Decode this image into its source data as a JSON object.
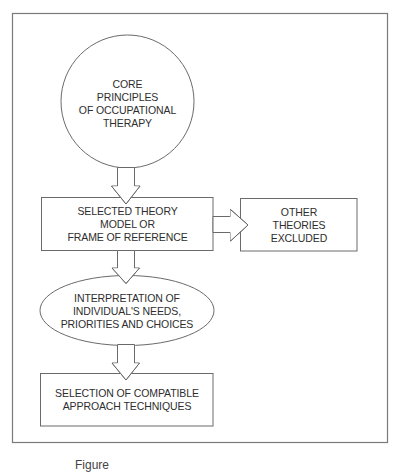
{
  "diagram": {
    "type": "flowchart",
    "nodes": [
      {
        "id": "core",
        "shape": "circle",
        "lines": [
          "CORE",
          "PRINCIPLES",
          "OF OCCUPATIONAL",
          "THERAPY"
        ]
      },
      {
        "id": "theory",
        "shape": "rectangle",
        "lines": [
          "SELECTED THEORY",
          "MODEL OR",
          "FRAME OF REFERENCE"
        ]
      },
      {
        "id": "excluded",
        "shape": "rectangle",
        "lines": [
          "OTHER",
          "THEORIES",
          "EXCLUDED"
        ]
      },
      {
        "id": "interpretation",
        "shape": "ellipse",
        "lines": [
          "INTERPRETATION OF",
          "INDIVIDUAL'S NEEDS,",
          "PRIORITIES AND CHOICES"
        ]
      },
      {
        "id": "selection",
        "shape": "rectangle",
        "lines": [
          "SELECTION OF COMPATIBLE",
          "APPROACH TECHNIQUES"
        ]
      }
    ],
    "edges": [
      {
        "from": "core",
        "to": "theory",
        "style": "block-arrow-down"
      },
      {
        "from": "theory",
        "to": "excluded",
        "style": "block-arrow-right"
      },
      {
        "from": "theory",
        "to": "interpretation",
        "style": "block-arrow-down"
      },
      {
        "from": "interpretation",
        "to": "selection",
        "style": "block-arrow-down"
      }
    ],
    "colors": {
      "stroke": "#6a6a6a",
      "text": "#2e2e2e",
      "background": "#ffffff"
    }
  },
  "caption": {
    "text": "Figure",
    "clipped": true
  }
}
